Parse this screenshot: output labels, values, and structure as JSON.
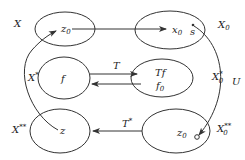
{
  "diagram": {
    "sets": {
      "X": {
        "label": "X",
        "point": "z",
        "point_sub": "0"
      },
      "X0": {
        "label": "X",
        "label_sub": "0",
        "points": [
          {
            "name": "x",
            "sub": "0"
          },
          {
            "name": "s"
          }
        ]
      },
      "Xstar": {
        "label": "X",
        "label_sup": "*",
        "point": "f"
      },
      "X0star": {
        "label": "X",
        "label_sub": "0",
        "label_sup": "*",
        "points": [
          {
            "name": "Tf"
          },
          {
            "name": "f",
            "sub": "0"
          }
        ]
      },
      "Xstarstar": {
        "label": "X",
        "label_sup": "**",
        "point": "z"
      },
      "X0starstar": {
        "label": "X",
        "label_sub": "0",
        "label_sup": "**",
        "point": "z",
        "point_sub": "0"
      }
    },
    "arrows": {
      "top": {
        "from": "z0",
        "to": "x0",
        "label": ""
      },
      "T": {
        "label": "T"
      },
      "T_back": {
        "label": ""
      },
      "Tstar": {
        "label": "T",
        "label_sup": "*"
      },
      "U": {
        "label": "U"
      },
      "curve_left": {
        "from": "z",
        "to": "z0",
        "label": ""
      }
    },
    "colors": {
      "stroke": "#333333",
      "text": "#222222"
    }
  }
}
